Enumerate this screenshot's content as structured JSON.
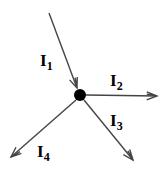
{
  "diagram": {
    "type": "circuit-node-currents",
    "node": {
      "x": 80,
      "y": 95,
      "r": 6,
      "color": "#000000"
    },
    "line_color": "#444444",
    "branches": [
      {
        "id": "I1",
        "label_base": "I",
        "label_sub": "1",
        "direction": "in",
        "from": [
          49,
          13
        ],
        "to": [
          77,
          88
        ],
        "label_pos": [
          40,
          52
        ]
      },
      {
        "id": "I2",
        "label_base": "I",
        "label_sub": "2",
        "direction": "out",
        "from": [
          86,
          95
        ],
        "to": [
          157,
          96
        ],
        "label_pos": [
          110,
          72
        ]
      },
      {
        "id": "I3",
        "label_base": "I",
        "label_sub": "3",
        "direction": "out",
        "from": [
          84,
          100
        ],
        "to": [
          133,
          160
        ],
        "label_pos": [
          110,
          112
        ]
      },
      {
        "id": "I4",
        "label_base": "I",
        "label_sub": "4",
        "direction": "out",
        "from": [
          76,
          100
        ],
        "to": [
          11,
          157
        ],
        "label_pos": [
          37,
          143
        ]
      }
    ]
  }
}
